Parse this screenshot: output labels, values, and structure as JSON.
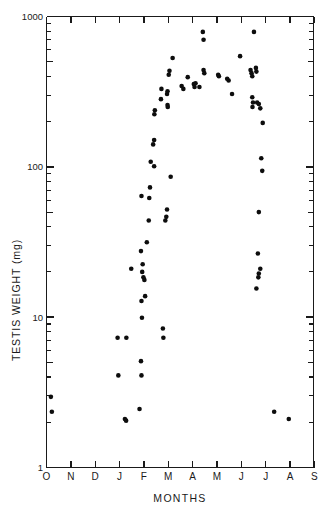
{
  "chart_data": {
    "type": "scatter",
    "title": "",
    "xlabel": "MONTHS",
    "ylabel": "TESTIS WEIGHT (mg)",
    "yscale": "log",
    "ylim": [
      1,
      1000
    ],
    "ytick_labels": [
      "1",
      "10",
      "100",
      "1000"
    ],
    "ytick_values": [
      1,
      10,
      100,
      1000
    ],
    "y_minor_ticks": [
      2,
      3,
      4,
      5,
      6,
      7,
      8,
      9
    ],
    "grid": false,
    "legend": null,
    "xtick_labels": [
      "O",
      "N",
      "D",
      "J",
      "F",
      "M",
      "A",
      "M",
      "J",
      "J",
      "A",
      "S"
    ],
    "xtick_names": [
      "October",
      "November",
      "December",
      "January",
      "February",
      "March",
      "April",
      "May",
      "June",
      "July",
      "August",
      "September"
    ],
    "xlim": [
      0,
      11.5
    ],
    "marker": "filled-circle",
    "marker_color": "#0d0d0d",
    "marker_size": 4.6,
    "points": [
      {
        "x": 0.18,
        "y": 2.95
      },
      {
        "x": 0.22,
        "y": 2.35
      },
      {
        "x": 2.95,
        "y": 4.1
      },
      {
        "x": 2.92,
        "y": 7.3
      },
      {
        "x": 3.22,
        "y": 2.1
      },
      {
        "x": 3.27,
        "y": 2.05
      },
      {
        "x": 3.28,
        "y": 7.3
      },
      {
        "x": 3.48,
        "y": 21.0
      },
      {
        "x": 3.82,
        "y": 2.45
      },
      {
        "x": 3.9,
        "y": 4.1
      },
      {
        "x": 3.88,
        "y": 5.1
      },
      {
        "x": 3.92,
        "y": 9.9
      },
      {
        "x": 3.9,
        "y": 12.8
      },
      {
        "x": 4.05,
        "y": 13.8
      },
      {
        "x": 3.93,
        "y": 20.0
      },
      {
        "x": 3.98,
        "y": 18.4
      },
      {
        "x": 4.02,
        "y": 17.7
      },
      {
        "x": 3.95,
        "y": 22.5
      },
      {
        "x": 3.88,
        "y": 27.5
      },
      {
        "x": 3.9,
        "y": 64.0
      },
      {
        "x": 4.12,
        "y": 31.5
      },
      {
        "x": 4.2,
        "y": 44.0
      },
      {
        "x": 4.22,
        "y": 62.0
      },
      {
        "x": 4.25,
        "y": 73.0
      },
      {
        "x": 4.28,
        "y": 108.0
      },
      {
        "x": 4.42,
        "y": 101.0
      },
      {
        "x": 4.38,
        "y": 141.0
      },
      {
        "x": 4.42,
        "y": 151.0
      },
      {
        "x": 4.43,
        "y": 224.0
      },
      {
        "x": 4.45,
        "y": 238.0
      },
      {
        "x": 4.78,
        "y": 8.4
      },
      {
        "x": 4.8,
        "y": 7.3
      },
      {
        "x": 4.88,
        "y": 44.0
      },
      {
        "x": 4.92,
        "y": 46.5
      },
      {
        "x": 4.95,
        "y": 52.0
      },
      {
        "x": 5.1,
        "y": 86.0
      },
      {
        "x": 4.7,
        "y": 282.0
      },
      {
        "x": 4.72,
        "y": 330.0
      },
      {
        "x": 4.95,
        "y": 305.0
      },
      {
        "x": 4.97,
        "y": 318.0
      },
      {
        "x": 4.97,
        "y": 258.0
      },
      {
        "x": 4.98,
        "y": 250.0
      },
      {
        "x": 5.02,
        "y": 410.0
      },
      {
        "x": 5.05,
        "y": 435.0
      },
      {
        "x": 5.18,
        "y": 530.0
      },
      {
        "x": 5.55,
        "y": 345.0
      },
      {
        "x": 5.62,
        "y": 330.0
      },
      {
        "x": 5.8,
        "y": 395.0
      },
      {
        "x": 6.05,
        "y": 355.0
      },
      {
        "x": 6.08,
        "y": 340.0
      },
      {
        "x": 6.12,
        "y": 360.0
      },
      {
        "x": 6.28,
        "y": 340.0
      },
      {
        "x": 6.45,
        "y": 440.0
      },
      {
        "x": 6.48,
        "y": 420.0
      },
      {
        "x": 6.42,
        "y": 790.0
      },
      {
        "x": 6.45,
        "y": 700.0
      },
      {
        "x": 7.05,
        "y": 410.0
      },
      {
        "x": 7.08,
        "y": 400.0
      },
      {
        "x": 7.42,
        "y": 385.0
      },
      {
        "x": 7.48,
        "y": 375.0
      },
      {
        "x": 7.62,
        "y": 305.0
      },
      {
        "x": 7.95,
        "y": 545.0
      },
      {
        "x": 8.38,
        "y": 440.0
      },
      {
        "x": 8.42,
        "y": 420.0
      },
      {
        "x": 8.45,
        "y": 400.0
      },
      {
        "x": 8.6,
        "y": 455.0
      },
      {
        "x": 8.62,
        "y": 430.0
      },
      {
        "x": 8.52,
        "y": 790.0
      },
      {
        "x": 8.45,
        "y": 290.0
      },
      {
        "x": 8.48,
        "y": 268.0
      },
      {
        "x": 8.46,
        "y": 250.0
      },
      {
        "x": 8.65,
        "y": 268.0
      },
      {
        "x": 8.72,
        "y": 262.0
      },
      {
        "x": 8.78,
        "y": 245.0
      },
      {
        "x": 8.88,
        "y": 196.0
      },
      {
        "x": 8.82,
        "y": 114.0
      },
      {
        "x": 8.86,
        "y": 94.0
      },
      {
        "x": 8.72,
        "y": 50.0
      },
      {
        "x": 8.68,
        "y": 26.5
      },
      {
        "x": 8.78,
        "y": 21.0
      },
      {
        "x": 8.72,
        "y": 19.5
      },
      {
        "x": 8.7,
        "y": 18.4
      },
      {
        "x": 8.62,
        "y": 15.5
      },
      {
        "x": 9.35,
        "y": 2.35
      },
      {
        "x": 9.95,
        "y": 2.1
      }
    ]
  },
  "figure": {
    "background": "#ffffff",
    "axis_color": "#1a1a1a"
  }
}
